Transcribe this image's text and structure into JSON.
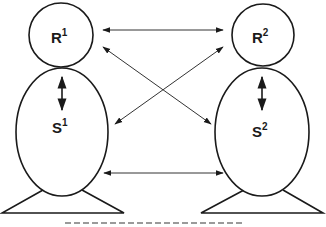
{
  "diagram": {
    "type": "two-person R/S relation model",
    "colors": {
      "stroke": "#1a1a1a",
      "arrow": "#333333",
      "background": "#ffffff"
    },
    "figures": [
      {
        "id": "person-1",
        "head": {
          "label": "R",
          "superscript": "1"
        },
        "body": {
          "label": "S",
          "superscript": "1"
        }
      },
      {
        "id": "person-2",
        "head": {
          "label": "R",
          "superscript": "2"
        },
        "body": {
          "label": "S",
          "superscript": "2"
        }
      }
    ],
    "relations": [
      {
        "from": "R1",
        "to": "R2",
        "style": "bidirectional-horizontal"
      },
      {
        "from": "S1",
        "to": "S2",
        "style": "bidirectional-horizontal"
      },
      {
        "from": "R1",
        "to": "S2",
        "style": "bidirectional-diagonal"
      },
      {
        "from": "R2",
        "to": "S1",
        "style": "bidirectional-diagonal"
      },
      {
        "from": "R1",
        "to": "S1",
        "style": "bidirectional-vertical"
      },
      {
        "from": "R2",
        "to": "S2",
        "style": "bidirectional-vertical"
      }
    ],
    "caption": {
      "note": "caption cut off at bottom edge, illegible"
    }
  }
}
